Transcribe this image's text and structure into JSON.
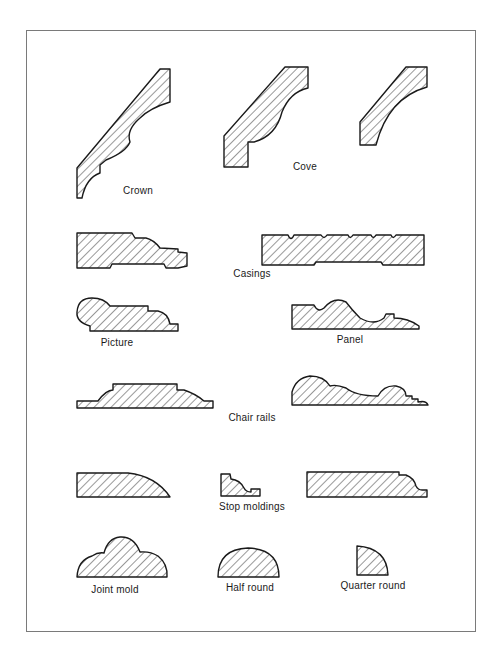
{
  "figure": {
    "colors": {
      "line": "#1a1a1a",
      "hatch": "#333333",
      "frame": "#7a7a7a",
      "background": "#ffffff"
    },
    "groups": [
      {
        "id": "crown",
        "label": "Crown",
        "profiles": 1
      },
      {
        "id": "cove",
        "label": "Cove",
        "profiles": 2
      },
      {
        "id": "casings",
        "label": "Casings",
        "profiles": 2
      },
      {
        "id": "picture",
        "label": "Picture",
        "profiles": 1
      },
      {
        "id": "panel",
        "label": "Panel",
        "profiles": 1
      },
      {
        "id": "chair-rails",
        "label": "Chair rails",
        "profiles": 2
      },
      {
        "id": "stop-moldings",
        "label": "Stop moldings",
        "profiles": 3
      },
      {
        "id": "joint-mold",
        "label": "Joint mold",
        "profiles": 1
      },
      {
        "id": "half-round",
        "label": "Half round",
        "profiles": 1
      },
      {
        "id": "quarter-round",
        "label": "Quarter round",
        "profiles": 1
      }
    ]
  },
  "labels": {
    "crown": "Crown",
    "cove": "Cove",
    "casings": "Casings",
    "picture": "Picture",
    "panel": "Panel",
    "chair_rails": "Chair rails",
    "stop_moldings": "Stop moldings",
    "joint_mold": "Joint mold",
    "half_round": "Half round",
    "quarter_round": "Quarter round"
  }
}
